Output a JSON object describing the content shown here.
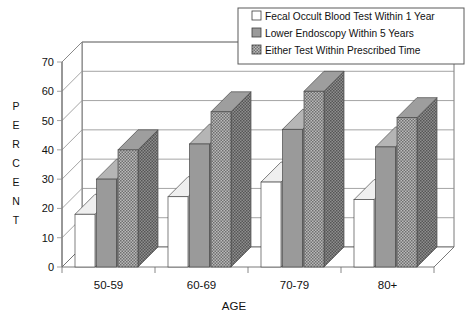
{
  "chart_data": {
    "type": "bar",
    "title": "",
    "subtitle": "",
    "xlabel": "AGE",
    "ylabel": "PERCENT",
    "categories": [
      "50-59",
      "60-69",
      "70-79",
      "80+"
    ],
    "series": [
      {
        "name": "Fecal Occult Blood Test Within 1 Year",
        "values": [
          18,
          24,
          29,
          23
        ],
        "fill": "#ffffff"
      },
      {
        "name": "Lower Endoscopy Within 5 Years",
        "values": [
          30,
          42,
          47,
          41
        ],
        "fill": "#9a9a9a"
      },
      {
        "name": "Either Test Within Prescribed Time",
        "values": [
          40,
          53,
          60,
          51
        ],
        "fill": "#8a8a8a"
      }
    ],
    "ylim": [
      0,
      70
    ],
    "yticks": [
      0,
      10,
      20,
      30,
      40,
      50,
      60,
      70
    ],
    "ytick_labels": [
      "0",
      "10",
      "20",
      "30",
      "40",
      "50",
      "60",
      "70"
    ],
    "grid": true,
    "grid_axis": "y",
    "legend_position": "top-right",
    "style": "3d-bar",
    "plot_bgcolor": "#ffffff",
    "grid_color": "#8d8d8d",
    "frame_color": "#6b6b6b"
  },
  "axis": {
    "y_title_letters": [
      "P",
      "E",
      "R",
      "C",
      "E",
      "N",
      "T"
    ],
    "x_title": "AGE"
  },
  "legend": {
    "items": [
      {
        "label": "Fecal Occult Blood Test Within 1 Year",
        "swatch": "swatch-white"
      },
      {
        "label": "Lower Endoscopy Within 5 Years",
        "swatch": "swatch-gray"
      },
      {
        "label": "Either Test Within Prescribed Time",
        "swatch": "swatch-dark"
      }
    ]
  }
}
